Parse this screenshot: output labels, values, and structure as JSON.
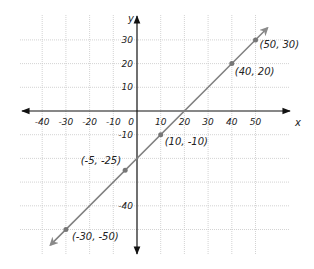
{
  "chart_data": {
    "type": "line",
    "title": "",
    "xlabel": "x",
    "ylabel": "y",
    "xlim": [
      -50,
      60
    ],
    "ylim": [
      -60,
      40
    ],
    "grid": true,
    "x_ticks": [
      -40,
      -30,
      -20,
      -10,
      0,
      10,
      20,
      30,
      40,
      50
    ],
    "x_tick_labels": [
      "-40",
      "-30",
      "-20",
      "-10",
      "0",
      "10",
      "20",
      "30",
      "40",
      "50"
    ],
    "y_ticks": [
      30,
      20,
      10,
      -10,
      -40
    ],
    "y_tick_labels": [
      "30",
      "20",
      "10",
      "-10",
      "-40"
    ],
    "series": [
      {
        "name": "line y = x - 20",
        "color": "#808080",
        "points": [
          {
            "x": -30,
            "y": -50,
            "label": "(-30, -50)"
          },
          {
            "x": -5,
            "y": -25,
            "label": "(-5, -25)"
          },
          {
            "x": 10,
            "y": -10,
            "label": "(10, -10)"
          },
          {
            "x": 40,
            "y": 20,
            "label": "(40, 20)"
          },
          {
            "x": 50,
            "y": 30,
            "label": "(50, 30)"
          }
        ]
      }
    ]
  }
}
